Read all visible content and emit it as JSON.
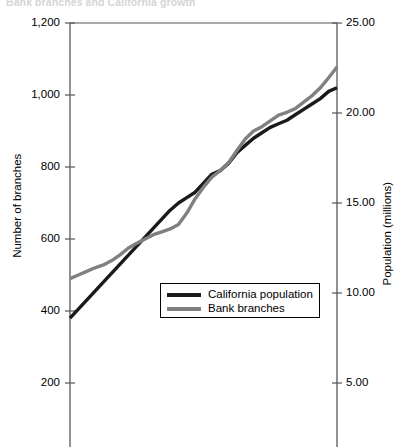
{
  "chart_data": {
    "type": "line",
    "title": "Bank branches and California growth",
    "xlabel": "",
    "grid": false,
    "legend_position": "center",
    "axes": {
      "left": {
        "label": "Number of branches",
        "ticks": [
          "200",
          "400",
          "600",
          "800",
          "1,000",
          "1,200"
        ],
        "tick_values": [
          200,
          400,
          600,
          800,
          1000,
          1200
        ],
        "ylim": [
          0,
          1200
        ]
      },
      "right": {
        "label": "Population (millions)",
        "ticks": [
          "5.00",
          "10.00",
          "15.00",
          "20.00",
          "25.00"
        ],
        "tick_values": [
          5,
          10,
          15,
          20,
          25
        ],
        "ylim": [
          0,
          25
        ]
      }
    },
    "series": [
      {
        "name": "California population",
        "axis": "right",
        "color": "#1a1a1a",
        "width": 3.4,
        "values": [
          8.6,
          9.1,
          9.6,
          10.1,
          10.6,
          11.1,
          11.6,
          12.1,
          12.6,
          13.1,
          13.6,
          14.1,
          14.6,
          15.0,
          15.3,
          15.6,
          16.1,
          16.6,
          16.8,
          17.2,
          17.8,
          18.2,
          18.6,
          18.9,
          19.2,
          19.4,
          19.6,
          19.9,
          20.2,
          20.5,
          20.8,
          21.2,
          21.4
        ]
      },
      {
        "name": "Bank branches",
        "axis": "left",
        "color": "#808080",
        "width": 3.4,
        "values": [
          490,
          500,
          510,
          520,
          528,
          540,
          556,
          575,
          588,
          600,
          612,
          620,
          628,
          640,
          672,
          712,
          744,
          772,
          790,
          812,
          846,
          878,
          900,
          912,
          928,
          944,
          952,
          962,
          980,
          998,
          1020,
          1048,
          1078
        ]
      }
    ]
  },
  "legend": {
    "items": [
      {
        "label": "California population",
        "color": "#1a1a1a"
      },
      {
        "label": "Bank branches",
        "color": "#808080"
      }
    ]
  }
}
